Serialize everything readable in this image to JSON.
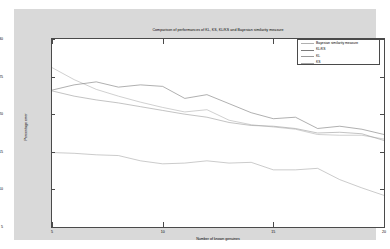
{
  "chart_data": {
    "type": "line",
    "title": "Comparison of performances of KL, KS, KL/KS and Bayesian similarity measure",
    "xlabel": "Number of known genuines",
    "ylabel": "Percentage error",
    "xlim": [
      5,
      20
    ],
    "ylim": [
      5,
      30
    ],
    "xticks": [
      5,
      10,
      15,
      20
    ],
    "yticks": [
      5,
      10,
      15,
      20,
      25,
      30
    ],
    "grid": false,
    "legend_position": "top-right",
    "x": [
      5,
      6,
      7,
      8,
      9,
      10,
      11,
      12,
      13,
      14,
      15,
      16,
      17,
      18,
      19,
      20
    ],
    "series": [
      {
        "name": "Bayesian similarity measure",
        "color": "#b0b0b0",
        "values": [
          26.2,
          24.6,
          23.3,
          22.4,
          21.6,
          20.9,
          20.3,
          20.6,
          19.2,
          18.6,
          18.3,
          18.0,
          17.3,
          17.2,
          17.2,
          16.7
        ]
      },
      {
        "name": "KL/KS",
        "color": "#7a7a7a",
        "values": [
          23.2,
          23.9,
          24.3,
          23.6,
          23.9,
          23.7,
          22.1,
          22.6,
          21.4,
          20.2,
          19.4,
          19.6,
          18.1,
          18.4,
          18.0,
          17.3
        ]
      },
      {
        "name": "KL",
        "color": "#9a9a9a",
        "values": [
          23.1,
          22.4,
          21.9,
          21.5,
          21.0,
          20.5,
          20.0,
          19.6,
          18.9,
          18.5,
          18.4,
          18.1,
          17.5,
          17.6,
          17.4,
          16.5
        ]
      },
      {
        "name": "KS",
        "color": "#a8a8a8",
        "values": [
          14.9,
          14.8,
          14.6,
          14.5,
          13.8,
          13.4,
          13.5,
          13.8,
          13.5,
          13.6,
          12.6,
          12.6,
          12.8,
          11.3,
          10.2,
          9.2
        ]
      }
    ]
  }
}
